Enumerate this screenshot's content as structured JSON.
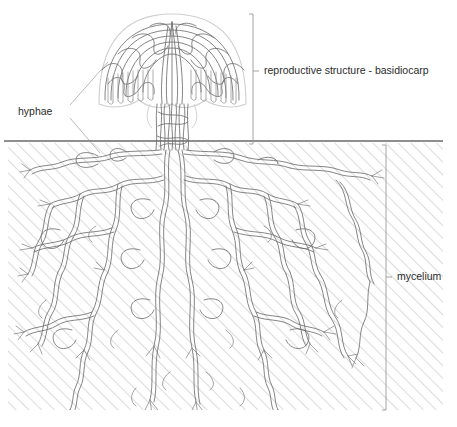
{
  "figure": {
    "background_color": "#ffffff",
    "line_color": "#6f6f6f",
    "hatch_color": "#d8d8d8",
    "text_color": "#2b2b2b",
    "bracket_color": "#9a9a9a"
  },
  "labels": {
    "basidiocarp": "reproductive structure - basidiocarp",
    "hyphae": "hyphae",
    "mycelium": "mycelium"
  },
  "regions": {
    "above_ground": {
      "name": "basidiocarp",
      "bracket_x": 253,
      "bracket_top": 14,
      "bracket_bottom": 144,
      "tick_y": 71,
      "label_x": 264,
      "label_y": 71
    },
    "below_ground": {
      "name": "mycelium",
      "bracket_x": 386,
      "bracket_top": 145,
      "bracket_bottom": 410,
      "tick_y": 277,
      "label_x": 397,
      "label_y": 277,
      "soil_x": 8,
      "soil_y": 143,
      "soil_width": 435,
      "soil_height": 267,
      "hatch_direction": "diagonal-up-right"
    },
    "ground_line": {
      "y": 141,
      "x_start": 4,
      "x_end": 443
    }
  },
  "callout": {
    "label": "hyphae",
    "label_x": 18,
    "label_y": 112,
    "leader_to_cap": "from (70,105) up-right to cap edge (108,62)",
    "leader_to_root": "from (70,118) down-right to root hypha (100,153)"
  },
  "structure": {
    "cap": {
      "center_x": 172,
      "center_y": 62,
      "radius_x": 74,
      "radius_y": 46,
      "description": "dome-shaped basidiocarp cap of interwoven hyphae"
    },
    "stalk": {
      "center_x": 172,
      "top_y": 60,
      "bottom_y": 150,
      "half_width": 16,
      "description": "braided hyphal stipe"
    },
    "mycelium_network": {
      "description": "dense branching hyphal network spreading through soil",
      "origin_x": 172,
      "origin_y": 150
    }
  }
}
